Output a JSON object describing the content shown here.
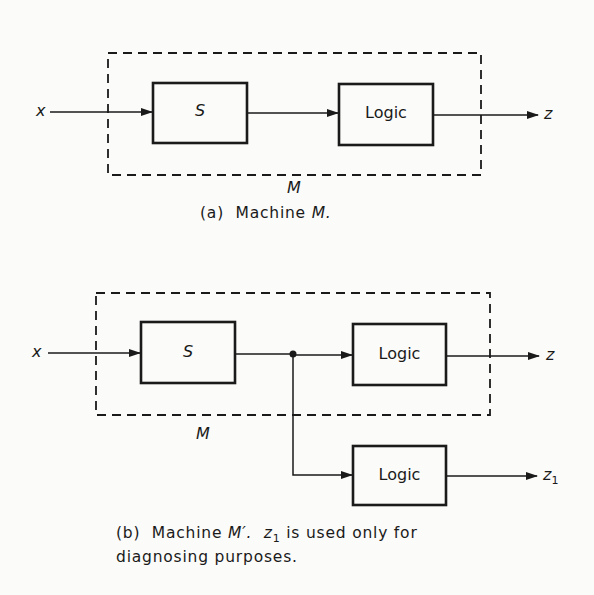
{
  "diagram_a": {
    "input_label": "x",
    "state_box_label": "S",
    "logic_box_label": "Logic",
    "output_label": "z",
    "machine_label": "M",
    "caption_prefix": "(a)",
    "caption_text": "Machine",
    "caption_machine": "M."
  },
  "diagram_b": {
    "input_label": "x",
    "state_box_label": "S",
    "logic_box_label": "Logic",
    "diagnostic_logic_box_label": "Logic",
    "output_label": "z",
    "diagnostic_output_label": "z",
    "diagnostic_output_subscript": "1",
    "machine_label": "M",
    "caption_prefix": "(b)",
    "caption_text": "Machine",
    "caption_machine": "M′.",
    "caption_z": "z",
    "caption_z_sub": "1",
    "caption_rest_line1": "is used only for",
    "caption_line2": "diagnosing purposes."
  },
  "colors": {
    "ink": "#1a1a1a",
    "paper": "#fbfbf9"
  }
}
